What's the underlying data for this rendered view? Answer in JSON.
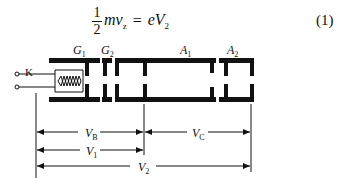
{
  "equation": {
    "fraction_numerator": "1",
    "fraction_denominator": "2",
    "lhs": "mv",
    "lhs_sub": "z",
    "equals": "=",
    "rhs": "eV",
    "rhs_sub": "2",
    "number": "(1)"
  },
  "electrodes": {
    "cathode": "K",
    "grid1": {
      "main": "G",
      "sub": "1"
    },
    "grid2": {
      "main": "G",
      "sub": "2"
    },
    "anode1": {
      "main": "A",
      "sub": "1"
    },
    "anode2": {
      "main": "A",
      "sub": "2"
    }
  },
  "voltages": {
    "vb": {
      "main": "V",
      "sub": "B"
    },
    "vc": {
      "main": "V",
      "sub": "C"
    },
    "v1": {
      "main": "V",
      "sub": "1"
    },
    "v2": {
      "main": "V",
      "sub": "2"
    }
  },
  "colors": {
    "ink": "#111111",
    "background": "#ffffff"
  }
}
